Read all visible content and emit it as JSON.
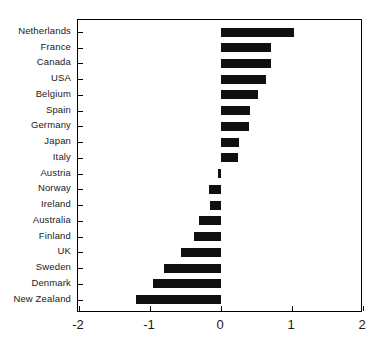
{
  "chart_data": {
    "type": "bar",
    "orientation": "horizontal",
    "title": "",
    "subtitle": "",
    "xlabel": "",
    "ylabel": "",
    "xlim": [
      -2,
      2
    ],
    "xticks": [
      -2,
      -1,
      0,
      1,
      2
    ],
    "xtick_labels": [
      "-2",
      "-1",
      "0",
      "1",
      "2"
    ],
    "grid": false,
    "legend": null,
    "bar_color": "#101010",
    "frame_color": "#000000",
    "categories": [
      "Netherlands",
      "France",
      "Canada",
      "USA",
      "Belgium",
      "Spain",
      "Germany",
      "Japan",
      "Italy",
      "Austria",
      "Norway",
      "Ireland",
      "Australia",
      "Finland",
      "UK",
      "Sweden",
      "Denmark",
      "New Zealand"
    ],
    "values": [
      1.03,
      0.7,
      0.7,
      0.64,
      0.52,
      0.41,
      0.39,
      0.25,
      0.24,
      -0.04,
      -0.17,
      -0.16,
      -0.31,
      -0.38,
      -0.56,
      -0.8,
      -0.96,
      -1.2
    ]
  }
}
